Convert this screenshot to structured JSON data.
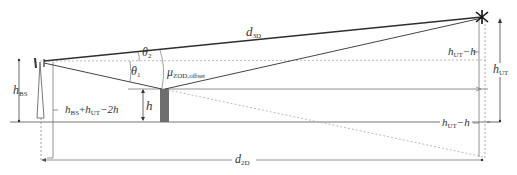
{
  "diagram": {
    "type": "geometry-schematic",
    "colors": {
      "line": "#3a3a3a",
      "thin_line": "#777777",
      "dashed": "#9a9a9a",
      "building": "#6e6e6e",
      "background": "#ffffff"
    },
    "labels": {
      "d3d": {
        "main": "d",
        "sub": "3D"
      },
      "d2d": {
        "main": "d",
        "sub": "2D"
      },
      "theta1": {
        "main": "θ",
        "sub": "1"
      },
      "theta2": {
        "main": "θ",
        "sub": "2"
      },
      "mu": {
        "main": "μ",
        "sub": "ZOD,offset"
      },
      "h": {
        "main": "h"
      },
      "hbs": {
        "main": "h",
        "sub": "BS"
      },
      "hut": {
        "main": "h",
        "sub": "UT"
      },
      "hut_minus_h_top": {
        "main": "h",
        "sub": "UT",
        "suffix": "−h"
      },
      "hut_minus_h_bottom": {
        "main": "h",
        "sub": "UT",
        "suffix": "−h"
      },
      "sum_expr": {
        "a": "h",
        "a_sub": "BS",
        "plus": "+",
        "b": "h",
        "b_sub": "UT",
        "suffix": "−2h"
      }
    },
    "nodes": [
      {
        "id": "base-station",
        "label": "BS antenna tower",
        "x": 40,
        "y": 62
      },
      {
        "id": "building-edge",
        "label": "obstacle of height h",
        "x": 163,
        "y": 89
      },
      {
        "id": "user-terminal",
        "label": "UT",
        "x": 482,
        "y": 17
      }
    ],
    "edges": [
      {
        "from": "base-station",
        "to": "user-terminal",
        "label": "d3D",
        "style": "solid"
      },
      {
        "from": "base-station",
        "to": "building-edge",
        "style": "solid"
      },
      {
        "from": "building-edge",
        "to": "user-terminal",
        "style": "solid"
      },
      {
        "from": "building-edge",
        "to": "image-of-UT",
        "style": "dashed"
      }
    ]
  }
}
